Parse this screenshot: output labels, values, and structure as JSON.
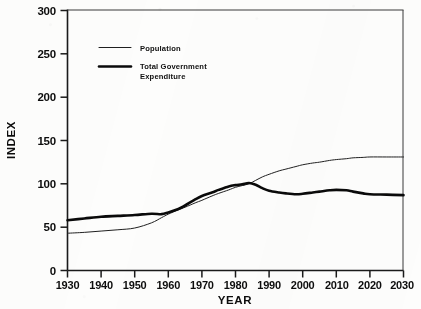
{
  "figure": {
    "background": "#fdfdfc",
    "ink_color": "#0d0d0d",
    "cropped_title_ghost": " "
  },
  "chart_data": {
    "type": "line",
    "title": "",
    "xlabel": "YEAR",
    "ylabel": "INDEX",
    "xlim": [
      1930,
      2030
    ],
    "ylim": [
      0,
      300
    ],
    "grid": false,
    "legend_position": "upper-left-inside",
    "xticks": [
      1930,
      1940,
      1950,
      1960,
      1970,
      1980,
      1990,
      2000,
      2010,
      2020,
      2030
    ],
    "xticklabels": [
      "1930",
      "1940",
      "1950",
      "1960",
      "1970",
      "1980",
      "1990",
      "2000",
      "2010",
      "2020",
      "2030"
    ],
    "yticks": [
      0,
      50,
      100,
      150,
      200,
      250,
      300
    ],
    "yticklabels": [
      "0",
      "50",
      "100",
      "150",
      "200",
      "250",
      "300"
    ],
    "x": [
      1930,
      1935,
      1940,
      1945,
      1950,
      1955,
      1958,
      1960,
      1963,
      1965,
      1968,
      1970,
      1973,
      1975,
      1978,
      1980,
      1982,
      1984,
      1986,
      1988,
      1990,
      1993,
      1995,
      1998,
      2000,
      2003,
      2005,
      2008,
      2010,
      2013,
      2015,
      2018,
      2020,
      2025,
      2030
    ],
    "series": [
      {
        "name": "Population",
        "style": "thin",
        "color": "#1f1f1f",
        "linewidth": 1,
        "values": [
          43,
          44,
          45.5,
          47,
          49,
          55,
          61,
          65,
          70,
          73,
          78,
          81,
          86,
          89,
          93,
          96,
          98,
          100,
          104,
          108,
          111,
          115,
          117,
          120,
          122,
          124,
          125,
          127,
          128,
          129,
          130,
          130.5,
          131,
          131,
          131
        ]
      },
      {
        "name": "Total Government Expenditure",
        "style": "thick",
        "color": "#0a0a0a",
        "linewidth": 2.6,
        "values": [
          58,
          60,
          62,
          63,
          64,
          65.5,
          65,
          67,
          71,
          75,
          82,
          86,
          90,
          93,
          97,
          98.5,
          99.5,
          101,
          99,
          95,
          92,
          90,
          89,
          88,
          88.5,
          90,
          91,
          92.5,
          93,
          92.5,
          91,
          89,
          88,
          87.5,
          87
        ]
      }
    ]
  },
  "legend": {
    "entries": [
      {
        "label": "Population",
        "style": "thin"
      },
      {
        "label": "Total Government",
        "label2": "Expenditure",
        "style": "thick"
      }
    ]
  }
}
